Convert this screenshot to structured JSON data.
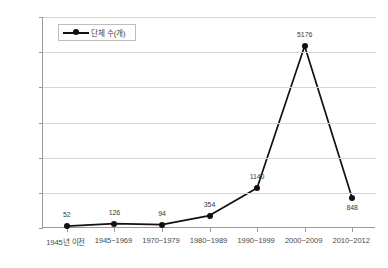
{
  "chart_data": {
    "type": "line",
    "title": "",
    "xlabel": "",
    "ylabel": "",
    "ylim": [
      0,
      6000
    ],
    "ytick_step": 1000,
    "grid": true,
    "legend_position": "top-left-inside",
    "categories": [
      "1945년 이전",
      "1945~1969",
      "1970~1979",
      "1980~1989",
      "1990~1999",
      "2000~2009",
      "2010~2012"
    ],
    "yticks": [
      "0",
      "1000",
      "2000",
      "3000",
      "4000",
      "5000",
      "6000"
    ],
    "series": [
      {
        "name": "단체 수(개)",
        "values": [
          52,
          126,
          94,
          354,
          1140,
          5176,
          848
        ],
        "labels": [
          "52",
          "126",
          "94",
          "354",
          "1140",
          "5176",
          "848"
        ],
        "color": "#111111",
        "marker": "circle"
      }
    ]
  },
  "legend": {
    "entries": [
      {
        "label": "단체 수(개)",
        "marker_icon": "line-marker-icon"
      }
    ]
  }
}
